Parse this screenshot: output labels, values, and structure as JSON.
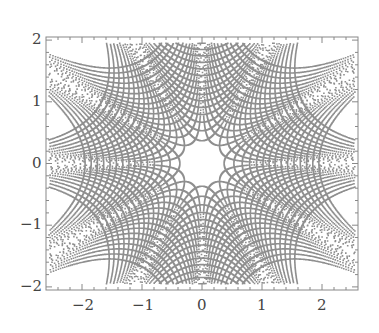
{
  "chart_data": {
    "type": "scatter",
    "title": "",
    "xlabel": "",
    "ylabel": "",
    "xlim": [
      -2.6,
      2.6
    ],
    "ylim": [
      -2.05,
      2.05
    ],
    "grid": false,
    "legend": null,
    "x_ticks": [
      -2,
      -1,
      0,
      1,
      2
    ],
    "y_ticks": [
      -2,
      -1,
      0,
      1,
      2
    ],
    "x_tick_labels": [
      "−2",
      "−1",
      "0",
      "1",
      "2"
    ],
    "y_tick_labels": [
      "−2",
      "−1",
      "0",
      "1",
      "2"
    ],
    "families": [
      {
        "name": "Re(z^3)=c",
        "levels": [
          0.05,
          0.15,
          0.3,
          0.5,
          0.75,
          1.05,
          1.4,
          1.8,
          2.3,
          2.9,
          3.6,
          4.4,
          5.3,
          6.3,
          7.4
        ]
      },
      {
        "name": "Im(z^3)=c",
        "levels": [
          0.05,
          0.15,
          0.3,
          0.5,
          0.75,
          1.05,
          1.4,
          1.8,
          2.3,
          2.9,
          3.6,
          4.4,
          5.3,
          6.3,
          7.4
        ]
      }
    ],
    "marker": {
      "color": "#333333",
      "size": 1.6
    }
  },
  "axes": {
    "frame_color": "#888888",
    "plot_box": {
      "left": 46,
      "top": 37,
      "right": 358,
      "bottom": 290
    }
  }
}
